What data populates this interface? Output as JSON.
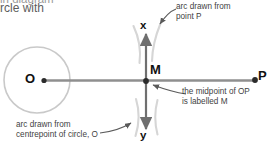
{
  "page": {
    "width": 268,
    "height": 151,
    "background": "#ffffff",
    "kind": "geometry-construction-diagram"
  },
  "cutoff_text": {
    "line1": "in diagram",
    "line2": "rcle with"
  },
  "callouts": {
    "arc_from_p": "arc drawn from\npoint P",
    "midpoint": "the midpoint of OP\nis labelled M",
    "arc_from_o": "arc drawn from\ncentrepoint of circle, O"
  },
  "labels": {
    "centre": "O",
    "midpoint": "M",
    "external_point": "P",
    "axis_top": "x",
    "axis_bottom": "y"
  },
  "colors": {
    "circle_stroke": "#c9c9c9",
    "line_stroke": "#8f8f8f",
    "arc_stroke": "#d5d5d5",
    "point_fill": "#2b2b2b",
    "text": "#3f3f3f",
    "label_text": "#111111",
    "leader_stroke": "#5a5a5a"
  },
  "geometry": {
    "circle": {
      "cx": 37,
      "cy": 80,
      "r": 33
    },
    "point_O": {
      "x": 44,
      "y": 80
    },
    "point_M": {
      "x": 146,
      "y": 81
    },
    "point_P": {
      "x": 256,
      "y": 80
    },
    "segment_OP": {
      "x1": 44,
      "y1": 80,
      "x2": 256,
      "y2": 80
    },
    "axis_xy": {
      "x": 146,
      "y_top": 32,
      "y_bottom": 131
    },
    "arcs": [
      {
        "name": "arc-from-O-upper",
        "d": "M 134 26 Q 141 44 139 62"
      },
      {
        "name": "arc-from-P-upper",
        "d": "M 160 24 Q 153 43 152 60"
      },
      {
        "name": "arc-from-O-lower",
        "d": "M 136 99 Q 141 117 136 136"
      },
      {
        "name": "arc-from-P-lower",
        "d": "M 157 100 Q 153 117 157 134"
      }
    ]
  }
}
